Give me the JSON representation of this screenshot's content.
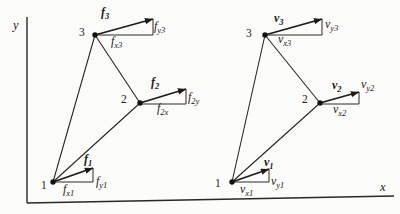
{
  "palette": {
    "paper": "#fcfcfa",
    "ink": "#1d1a17"
  },
  "axes": {
    "x_label": "x",
    "y_label": "y"
  },
  "left": {
    "node1": {
      "number": "1",
      "vector": {
        "main": "f",
        "sub": "1"
      },
      "x_comp": {
        "main": "f",
        "sub": "x1"
      },
      "y_comp": {
        "main": "f",
        "sub": "y1"
      }
    },
    "node2": {
      "number": "2",
      "vector": {
        "main": "f",
        "sub": "2"
      },
      "x_comp": {
        "main": "f",
        "sub": "2x"
      },
      "y_comp": {
        "main": "f",
        "sub": "2y"
      }
    },
    "node3": {
      "number": "3",
      "vector": {
        "main": "f",
        "sub": "3"
      },
      "x_comp": {
        "main": "f",
        "sub": "x3"
      },
      "y_comp": {
        "main": "f",
        "sub": "y3"
      }
    }
  },
  "right": {
    "node1": {
      "number": "1",
      "vector": {
        "main": "v",
        "sub": "1"
      },
      "x_comp": {
        "main": "v",
        "sub": "x1"
      },
      "y_comp": {
        "main": "v",
        "sub": "y1"
      }
    },
    "node2": {
      "number": "2",
      "vector": {
        "main": "v",
        "sub": "2"
      },
      "x_comp": {
        "main": "v",
        "sub": "x2"
      },
      "y_comp": {
        "main": "v",
        "sub": "y2"
      }
    },
    "node3": {
      "number": "3",
      "vector": {
        "main": "v",
        "sub": "3"
      },
      "x_comp": {
        "main": "v",
        "sub": "x3"
      },
      "y_comp": {
        "main": "v",
        "sub": "y3"
      }
    }
  }
}
